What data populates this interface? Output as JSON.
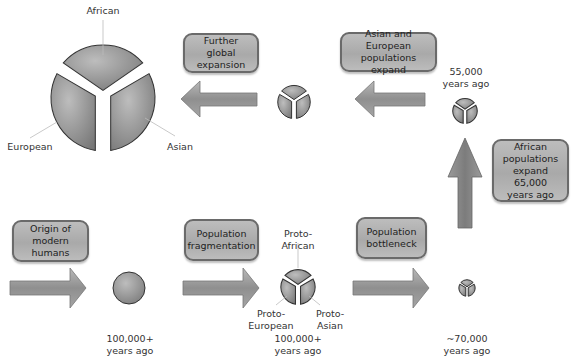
{
  "colors": {
    "box_fill": "#b0b0b0",
    "box_border": "#6a6a6a",
    "arrow": "#8a8a8a",
    "segment": "#8f8f8f",
    "text": "#333333"
  },
  "steps": [
    {
      "box": "Origin of\nmodern humans",
      "stage": "single-population",
      "time": "100,000+\nyears ago"
    },
    {
      "box": "Population\nfragmentation",
      "stage": "fragmented",
      "time": "100,000+\nyears ago",
      "segment_labels": {
        "top": "Proto-\nAfrican",
        "left": "Proto-\nEuropean",
        "right": "Proto-\nAsian"
      }
    },
    {
      "box": "Population\nbottleneck",
      "stage": "bottleneck",
      "time": "~70,000\nyears ago"
    },
    {
      "box": "African\npopulations\nexpand 65,000\nyears ago",
      "stage": "african-expansion",
      "time": "55,000\nyears ago"
    },
    {
      "box": "Asian and European\npopulations expand",
      "stage": "asian-european-expansion"
    },
    {
      "box": "Further global\nexpansion",
      "stage": "global",
      "segment_labels": {
        "top": "African",
        "left": "European",
        "right": "Asian"
      }
    }
  ]
}
